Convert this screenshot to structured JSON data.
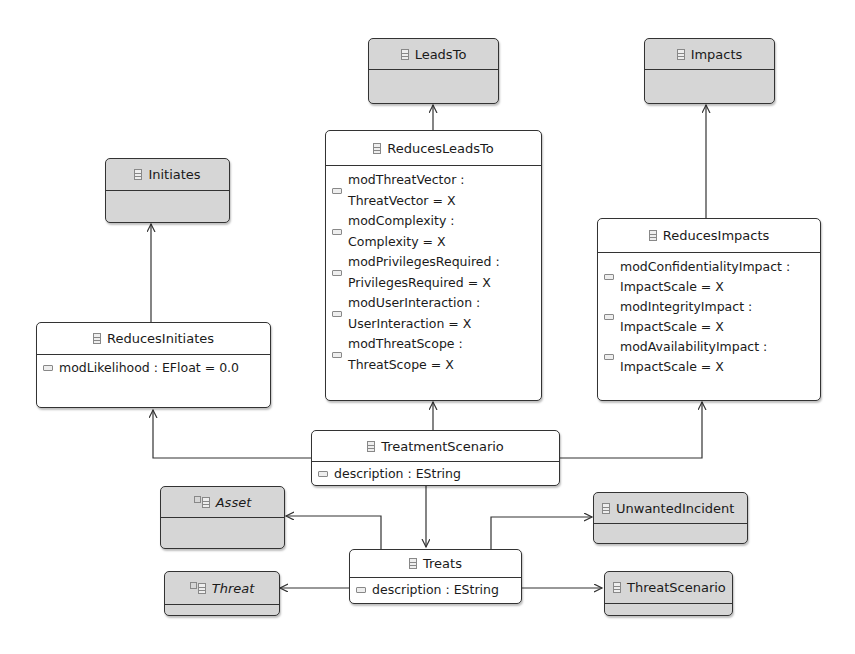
{
  "diagram": {
    "type": "UML class diagram (Ecore)",
    "classes": {
      "leadsTo": {
        "name": "LeadsTo"
      },
      "impacts": {
        "name": "Impacts"
      },
      "initiates": {
        "name": "Initiates"
      },
      "reducesLeadsTo": {
        "name": "ReducesLeadsTo",
        "attributes": [
          "modThreatVector :\nThreatVector = X",
          "modComplexity :\nComplexity = X",
          "modPrivilegesRequired :\nPrivilegesRequired = X",
          "modUserInteraction :\nUserInteraction = X",
          "modThreatScope :\nThreatScope = X"
        ]
      },
      "reducesImpacts": {
        "name": "ReducesImpacts",
        "attributes": [
          "modConfidentialityImpact :\nImpactScale = X",
          "modIntegrityImpact :\nImpactScale = X",
          "modAvailabilityImpact :\nImpactScale = X"
        ]
      },
      "reducesInitiates": {
        "name": "ReducesInitiates",
        "attributes": [
          "modLikelihood : EFloat = 0.0"
        ]
      },
      "treatmentScenario": {
        "name": "TreatmentScenario",
        "attributes": [
          "description : EString"
        ]
      },
      "asset": {
        "name": "Asset",
        "abstract": true
      },
      "threat": {
        "name": "Threat",
        "abstract": true
      },
      "treats": {
        "name": "Treats",
        "attributes": [
          "description : EString"
        ]
      },
      "unwantedIncident": {
        "name": "UnwantedIncident"
      },
      "threatScenario": {
        "name": "ThreatScenario"
      }
    },
    "edges": [
      {
        "from": "ReducesLeadsTo",
        "to": "LeadsTo",
        "kind": "generalization"
      },
      {
        "from": "ReducesImpacts",
        "to": "Impacts",
        "kind": "generalization"
      },
      {
        "from": "ReducesInitiates",
        "to": "Initiates",
        "kind": "generalization"
      },
      {
        "from": "TreatmentScenario",
        "to": "ReducesInitiates",
        "kind": "reference"
      },
      {
        "from": "TreatmentScenario",
        "to": "ReducesLeadsTo",
        "kind": "reference"
      },
      {
        "from": "TreatmentScenario",
        "to": "ReducesImpacts",
        "kind": "reference"
      },
      {
        "from": "TreatmentScenario",
        "to": "Treats",
        "kind": "reference"
      },
      {
        "from": "Treats",
        "to": "Asset",
        "kind": "reference"
      },
      {
        "from": "Treats",
        "to": "Threat",
        "kind": "reference"
      },
      {
        "from": "Treats",
        "to": "UnwantedIncident",
        "kind": "reference"
      },
      {
        "from": "Treats",
        "to": "ThreatScenario",
        "kind": "reference"
      }
    ],
    "colors": {
      "referenced_class_fill": "#d6d6d6",
      "class_fill": "#ffffff",
      "border": "#333333"
    }
  }
}
